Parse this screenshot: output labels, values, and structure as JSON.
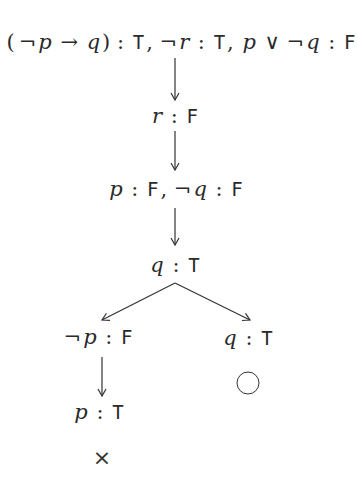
{
  "diagram": {
    "type": "semantic-tableau",
    "nodes": {
      "root": {
        "label": "(¬p → q) : T, ¬r : T, p ∨ ¬q : F",
        "parts": [
          {
            "t": "(",
            "k": "op"
          },
          {
            "t": "¬",
            "k": "op"
          },
          {
            "t": "p",
            "k": "it"
          },
          {
            "t": " → ",
            "k": "op"
          },
          {
            "t": "q",
            "k": "it"
          },
          {
            "t": ") : ",
            "k": "op"
          },
          {
            "t": "T",
            "k": "tt"
          },
          {
            "t": ", ¬",
            "k": "op"
          },
          {
            "t": "r",
            "k": "it"
          },
          {
            "t": " : ",
            "k": "op"
          },
          {
            "t": "T",
            "k": "tt"
          },
          {
            "t": ", ",
            "k": "op"
          },
          {
            "t": "p",
            "k": "it"
          },
          {
            "t": " ∨ ¬",
            "k": "op"
          },
          {
            "t": "q",
            "k": "it"
          },
          {
            "t": " : ",
            "k": "op"
          },
          {
            "t": "F",
            "k": "tt"
          }
        ]
      },
      "n1": {
        "label": "r : F",
        "var": "r",
        "sep": " : ",
        "value": "F"
      },
      "n2": {
        "label": "p : F, ¬q : F",
        "var1": "p",
        "sep1": " : ",
        "value1": "F",
        "comma": ", ¬",
        "var2": "q",
        "sep2": " : ",
        "value2": "F"
      },
      "n3": {
        "label": "q : T",
        "var": "q",
        "sep": " : ",
        "value": "T"
      },
      "left": {
        "label": "¬p : F",
        "neg": "¬",
        "var": "p",
        "sep": " : ",
        "value": "F"
      },
      "left_child": {
        "label": "p : T",
        "var": "p",
        "sep": " : ",
        "value": "T"
      },
      "right": {
        "label": "q : T",
        "var": "q",
        "sep": " : ",
        "value": "T"
      }
    },
    "edges": [
      {
        "from": "root",
        "to": "n1"
      },
      {
        "from": "n1",
        "to": "n2"
      },
      {
        "from": "n2",
        "to": "n3"
      },
      {
        "from": "n3",
        "to": "left"
      },
      {
        "from": "n3",
        "to": "right"
      },
      {
        "from": "left",
        "to": "left_child"
      }
    ],
    "branch_marks": {
      "left_closed": "×",
      "right_open": "○"
    },
    "colors": {
      "ink": "#2a2a2a",
      "background": "#ffffff"
    }
  }
}
